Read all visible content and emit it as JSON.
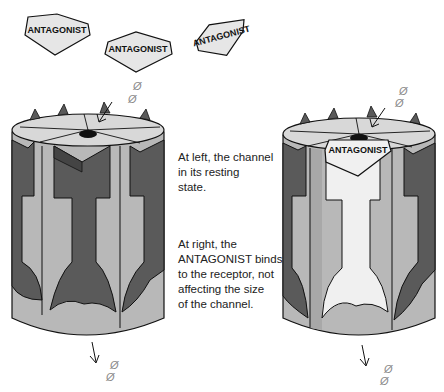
{
  "diagram": {
    "free_antagonists": [
      {
        "label": "ANTAGONIST",
        "x": 57,
        "y": 30,
        "rotation": 0
      },
      {
        "label": "ANTAGONIST",
        "x": 137,
        "y": 48,
        "rotation": 0
      },
      {
        "label": "ANTAGONIST",
        "x": 221,
        "y": 35,
        "rotation": -15
      }
    ],
    "bound_antagonist": {
      "label": "ANTAGONIST"
    },
    "ion_symbol": "Ø",
    "colors": {
      "dark_subunit": "#5a5a5a",
      "light_subunit": "#b8b8b8",
      "top_surface": "#d8d8d8",
      "bound_antagonist_fill": "#f0f0f0",
      "free_antagonist_fill": "#e6e6e6",
      "outline": "#111111",
      "ion": "#888888"
    }
  },
  "captions": {
    "left": {
      "lines": [
        "At left, the channel",
        "in its resting",
        "state."
      ]
    },
    "right": {
      "lines": [
        "At right, the",
        "ANTAGONIST binds",
        "to the receptor, not",
        "affecting the size",
        "of the channel."
      ]
    }
  },
  "panels": [
    {
      "name": "left-channel",
      "state": "resting"
    },
    {
      "name": "right-channel",
      "state": "antagonist-bound"
    }
  ]
}
